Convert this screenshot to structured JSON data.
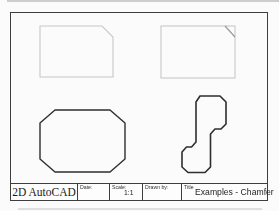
{
  "colors": {
    "faint_shape": "#c8c8c8",
    "chamfer_guide": "#9a9a9a",
    "dark_shape": "#2e2e2e",
    "frame": "#3e3e3e"
  },
  "title_block": {
    "product": "2D AutoCAD",
    "date_label": "Date:",
    "scale_label": "Scale:",
    "scale_value": "1:1",
    "drawn_by_label": "Drawn by:",
    "title_label": "Title",
    "title_value": "Examples - Chamfer"
  }
}
